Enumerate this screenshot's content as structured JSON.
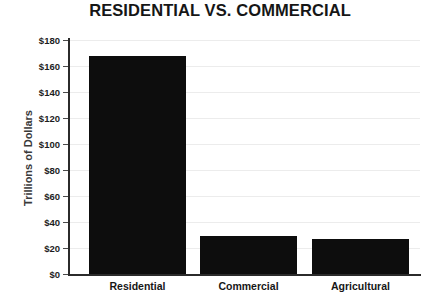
{
  "chart_data": {
    "type": "bar",
    "title": "RESIDENTIAL VS. COMMERCIAL",
    "xlabel": "",
    "ylabel": "Trillions of Dollars",
    "categories": [
      "Residential",
      "Commercial",
      "Agricultural"
    ],
    "values": [
      168,
      29,
      27
    ],
    "ylim": [
      0,
      180
    ],
    "ytick_step": 20,
    "ytick_labels": [
      "$0",
      "$20",
      "$40",
      "$60",
      "$80",
      "$100",
      "$120",
      "$140",
      "$160",
      "$180"
    ],
    "ytick_values": [
      0,
      20,
      40,
      60,
      80,
      100,
      120,
      140,
      160,
      180
    ],
    "grid": true,
    "legend": false,
    "series": [
      {
        "name": "Value",
        "values": [
          168,
          29,
          27
        ],
        "color": "#0d0d0d"
      }
    ],
    "colors": {
      "bar": "#0d0d0d",
      "background": "#ffffff",
      "gridline": "#ececec",
      "axis": "#2b2b2b",
      "title_text": "#161616",
      "tick_text": "#1d1d1d",
      "axis_label_text": "#3a3a3a"
    }
  }
}
